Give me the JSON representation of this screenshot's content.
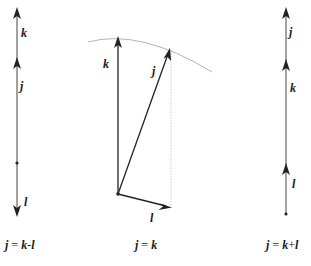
{
  "figure": {
    "panels": [
      {
        "id": "j-equals-k-minus-l",
        "caption": {
          "j": "j",
          "eq": " = ",
          "k": "k",
          "op": "-",
          "l": "l"
        },
        "vectors": [
          {
            "name": "k",
            "label": "k"
          },
          {
            "name": "j",
            "label": "j"
          },
          {
            "name": "l",
            "label": "l"
          }
        ],
        "description": "Collinear vectors: k and j point up, l points down; j = k - l"
      },
      {
        "id": "j-equals-k",
        "caption": {
          "j": "j",
          "eq": " = ",
          "k": "k"
        },
        "vectors": [
          {
            "name": "k",
            "label": "k"
          },
          {
            "name": "j",
            "label": "j"
          },
          {
            "name": "l",
            "label": "l"
          }
        ],
        "description": "k vertical, j tilted to the right, l pointing right-down; j and k end on a common arc"
      },
      {
        "id": "j-equals-k-plus-l",
        "caption": {
          "j": "j",
          "eq": " = ",
          "k": "k",
          "op": "+",
          "l": "l"
        },
        "vectors": [
          {
            "name": "j",
            "label": "j"
          },
          {
            "name": "k",
            "label": "k"
          },
          {
            "name": "l",
            "label": "l"
          }
        ],
        "description": "Collinear vectors stacked upward: l, then k, then j; j = k + l"
      }
    ]
  }
}
